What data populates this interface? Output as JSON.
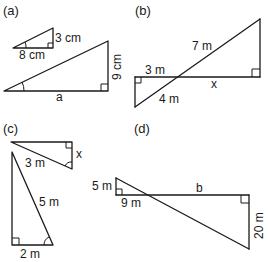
{
  "figure": {
    "panels": [
      {
        "id": "a",
        "label": "(a)",
        "small_triangle": {
          "opposite": "3 cm",
          "adjacent": "8 cm"
        },
        "large_triangle": {
          "opposite": "9 cm",
          "adjacent": "a"
        }
      },
      {
        "id": "b",
        "label": "(b)",
        "labels": {
          "upper_hypotenuse": "7 m",
          "left_segment": "3 m",
          "right_segment": "x",
          "lower_hypotenuse": "4 m"
        }
      },
      {
        "id": "c",
        "label": "(c)",
        "small_triangle": {
          "hypotenuse": "3 m",
          "side": "x"
        },
        "large_triangle": {
          "hypotenuse": "5 m",
          "base": "2 m"
        }
      },
      {
        "id": "d",
        "label": "(d)",
        "labels": {
          "left_vertical": "5 m",
          "left_horizontal": "9 m",
          "right_horizontal": "b",
          "right_vertical": "20 m"
        }
      }
    ]
  }
}
